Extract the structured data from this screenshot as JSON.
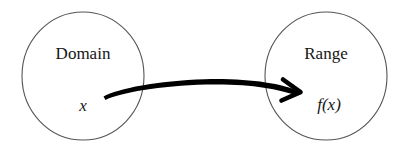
{
  "diagram": {
    "type": "function-mapping",
    "background_color": "#ffffff",
    "stroke_color": "#555555",
    "text_color": "#161616",
    "arrow_color": "#000000",
    "sets": [
      {
        "id": "domain",
        "title": "Domain",
        "element": "x",
        "center_x": 83,
        "center_y": 76,
        "radius_x": 61,
        "radius_y": 64,
        "title_x": 83,
        "title_y": 59,
        "element_x": 83,
        "element_y": 111
      },
      {
        "id": "range",
        "title": "Range",
        "element": "f(x)",
        "center_x": 326,
        "center_y": 76,
        "radius_x": 61,
        "radius_y": 64,
        "title_x": 326,
        "title_y": 59,
        "element_x": 329,
        "element_y": 110
      }
    ],
    "arrow": {
      "label": "",
      "from": "x",
      "to": "f(x)",
      "tail_x": 103,
      "tail_y": 96,
      "tip_x": 301,
      "tip_y": 92,
      "apex_y": 79,
      "body_path": "M 103.5 96.5 C 118 88.5 158 80.5 205 79.2 C 250 78.2 280 83.5 299 91.0 L 296.5 95.5 C 277 88.6 249 83.6 206 84.6 C 160 85.7 120 93.0 105.5 100.0 Z",
      "head_path": "M 283 79.5 L 300.5 92.2 L 281.5 100.5"
    }
  }
}
